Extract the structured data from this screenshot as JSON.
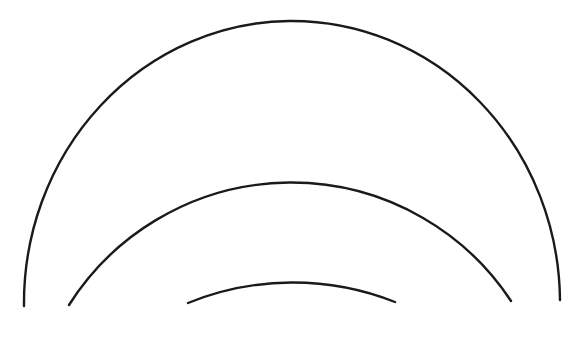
{
  "diagram": {
    "background": "#ffffff",
    "stroke_color": "#1a1a1a",
    "stroke_width": 2.4,
    "arcs": [
      {
        "name": "outer-arc",
        "d": "M 24 306 A 268 282 0 0 1 560 300"
      },
      {
        "name": "middle-arc",
        "d": "M 69 305 A 263 263 0 0 1 511 301"
      },
      {
        "name": "inner-arc",
        "d": "M 188 303 A 278 278 0 0 1 395 302"
      }
    ]
  }
}
